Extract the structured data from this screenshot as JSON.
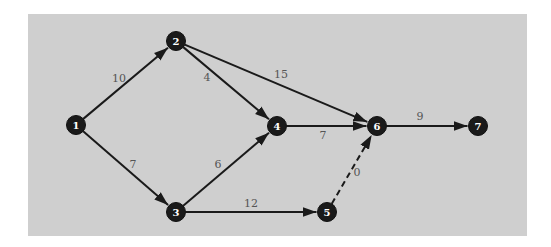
{
  "diagram": {
    "type": "network",
    "panel_color": "#cfcfcf",
    "edge_color": "#1a1a1a",
    "node_color": "#1a1a1a",
    "node_text_color": "#ffffff",
    "label_color": "#555555",
    "nodes": [
      {
        "id": "1",
        "label": "1",
        "x": 76,
        "y": 125
      },
      {
        "id": "2",
        "label": "2",
        "x": 176,
        "y": 41
      },
      {
        "id": "3",
        "label": "3",
        "x": 176,
        "y": 212
      },
      {
        "id": "4",
        "label": "4",
        "x": 277,
        "y": 126
      },
      {
        "id": "5",
        "label": "5",
        "x": 327,
        "y": 212
      },
      {
        "id": "6",
        "label": "6",
        "x": 377,
        "y": 126
      },
      {
        "id": "7",
        "label": "7",
        "x": 478,
        "y": 126
      }
    ],
    "edges": [
      {
        "from": "1",
        "to": "2",
        "weight": "10",
        "label_x": 119,
        "label_y": 82,
        "dashed": false
      },
      {
        "from": "1",
        "to": "3",
        "weight": "7",
        "label_x": 133,
        "label_y": 168,
        "dashed": false
      },
      {
        "from": "2",
        "to": "4",
        "weight": "4",
        "label_x": 207,
        "label_y": 81,
        "dashed": false
      },
      {
        "from": "2",
        "to": "6",
        "weight": "15",
        "label_x": 281,
        "label_y": 78,
        "dashed": false
      },
      {
        "from": "3",
        "to": "4",
        "weight": "6",
        "label_x": 218,
        "label_y": 168,
        "dashed": false
      },
      {
        "from": "3",
        "to": "5",
        "weight": "12",
        "label_x": 251,
        "label_y": 207,
        "dashed": false
      },
      {
        "from": "4",
        "to": "6",
        "weight": "7",
        "label_x": 323,
        "label_y": 139,
        "dashed": false
      },
      {
        "from": "5",
        "to": "6",
        "weight": "0",
        "label_x": 357,
        "label_y": 176,
        "dashed": true
      },
      {
        "from": "6",
        "to": "7",
        "weight": "9",
        "label_x": 420,
        "label_y": 120,
        "dashed": false
      }
    ]
  }
}
